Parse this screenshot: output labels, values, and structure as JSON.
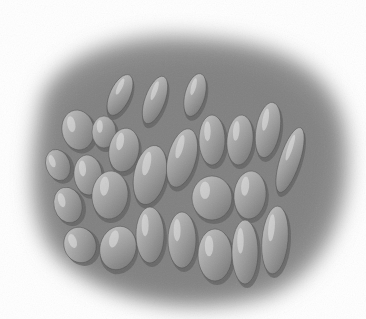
{
  "image": {
    "subject": "pencil illustration of rounded cobblestone-like cells",
    "style": "grayscale",
    "colors": {
      "background": "#ffffff",
      "tissue": "#8a8a8a",
      "tissue_dark": "#5e5e5e",
      "cell": "#a4a4a4",
      "cell_highlight": "#e6e6e6",
      "cell_outline": "#4a4a4a"
    },
    "cells": [
      {
        "cx": 78,
        "cy": 130,
        "rx": 16,
        "ry": 20,
        "rot": -10
      },
      {
        "cx": 104,
        "cy": 132,
        "rx": 12,
        "ry": 16,
        "rot": 0
      },
      {
        "cx": 58,
        "cy": 165,
        "rx": 12,
        "ry": 16,
        "rot": -20
      },
      {
        "cx": 88,
        "cy": 175,
        "rx": 14,
        "ry": 20,
        "rot": -5
      },
      {
        "cx": 124,
        "cy": 150,
        "rx": 15,
        "ry": 22,
        "rot": 10
      },
      {
        "cx": 68,
        "cy": 205,
        "rx": 14,
        "ry": 18,
        "rot": -15
      },
      {
        "cx": 110,
        "cy": 195,
        "rx": 18,
        "ry": 24,
        "rot": 5
      },
      {
        "cx": 150,
        "cy": 175,
        "rx": 16,
        "ry": 30,
        "rot": 12
      },
      {
        "cx": 182,
        "cy": 158,
        "rx": 14,
        "ry": 30,
        "rot": 15
      },
      {
        "cx": 212,
        "cy": 140,
        "rx": 13,
        "ry": 25,
        "rot": 0
      },
      {
        "cx": 240,
        "cy": 140,
        "rx": 13,
        "ry": 25,
        "rot": 5
      },
      {
        "cx": 268,
        "cy": 130,
        "rx": 12,
        "ry": 28,
        "rot": 10
      },
      {
        "cx": 212,
        "cy": 198,
        "rx": 20,
        "ry": 22,
        "rot": 0
      },
      {
        "cx": 250,
        "cy": 195,
        "rx": 16,
        "ry": 24,
        "rot": 5
      },
      {
        "cx": 290,
        "cy": 160,
        "rx": 10,
        "ry": 34,
        "rot": 18
      },
      {
        "cx": 80,
        "cy": 245,
        "rx": 16,
        "ry": 18,
        "rot": -20
      },
      {
        "cx": 118,
        "cy": 248,
        "rx": 18,
        "ry": 22,
        "rot": 15
      },
      {
        "cx": 150,
        "cy": 235,
        "rx": 14,
        "ry": 28,
        "rot": 0
      },
      {
        "cx": 182,
        "cy": 240,
        "rx": 14,
        "ry": 28,
        "rot": 0
      },
      {
        "cx": 215,
        "cy": 255,
        "rx": 17,
        "ry": 26,
        "rot": 0
      },
      {
        "cx": 245,
        "cy": 252,
        "rx": 13,
        "ry": 32,
        "rot": 0
      },
      {
        "cx": 275,
        "cy": 240,
        "rx": 13,
        "ry": 34,
        "rot": 5
      },
      {
        "cx": 120,
        "cy": 95,
        "rx": 10,
        "ry": 22,
        "rot": 25
      },
      {
        "cx": 155,
        "cy": 100,
        "rx": 10,
        "ry": 25,
        "rot": 20
      },
      {
        "cx": 195,
        "cy": 95,
        "rx": 10,
        "ry": 22,
        "rot": 15
      }
    ]
  }
}
